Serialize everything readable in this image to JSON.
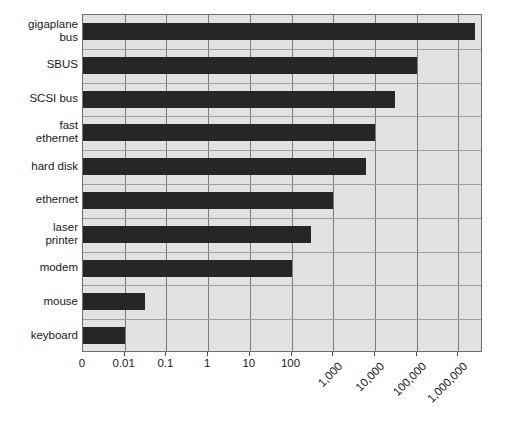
{
  "chart_data": {
    "type": "bar",
    "orientation": "horizontal",
    "title": "",
    "xlabel": "",
    "ylabel": "",
    "xscale": "log",
    "grid": true,
    "legend": null,
    "categories": [
      "gigaplane bus",
      "SBUS",
      "SCSI bus",
      "fast ethernet",
      "hard disk",
      "ethernet",
      "laser printer",
      "modem",
      "mouse",
      "keyboard"
    ],
    "category_label_lines": [
      [
        "gigaplane",
        "bus"
      ],
      [
        "SBUS"
      ],
      [
        "SCSI bus"
      ],
      [
        "fast",
        "ethernet"
      ],
      [
        "hard disk"
      ],
      [
        "ethernet"
      ],
      [
        "laser",
        "printer"
      ],
      [
        "modem"
      ],
      [
        "mouse"
      ],
      [
        "keyboard"
      ]
    ],
    "values": [
      2500000,
      100000,
      30000,
      10000,
      6000,
      1000,
      300,
      100,
      0.03,
      0.01
    ],
    "tick_values": [
      0,
      0.01,
      0.1,
      1,
      10,
      100,
      1000,
      10000,
      100000,
      1000000
    ],
    "tick_labels": [
      "0",
      "0.01",
      "0.1",
      "1",
      "10",
      "100",
      "1,000",
      "10,000",
      "100,000",
      "1,000,000"
    ],
    "tick_rotated": [
      false,
      false,
      false,
      false,
      false,
      false,
      true,
      true,
      true,
      true
    ],
    "xlim": [
      0,
      1000000
    ],
    "colors": {
      "bar": "#262626",
      "plot_background": "#e2e2e2",
      "gridline": "#7a7a7a",
      "row_separator": "#9c9c9c",
      "plot_border": "#6f6f6f",
      "page_background": "#ffffff",
      "text": "#1a1a1a"
    }
  }
}
